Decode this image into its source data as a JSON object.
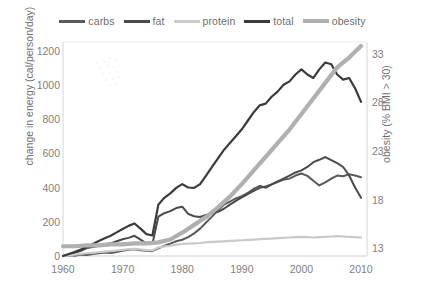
{
  "chart_data": {
    "type": "line",
    "title": "",
    "xlabel": "",
    "ylabel": "change in energy (cal/person/day)",
    "y2label": "obesity (% BMI > 30)",
    "grid": false,
    "legend_position": "top",
    "xlim": [
      1960,
      2011
    ],
    "ylim": [
      0,
      1250
    ],
    "y2lim": [
      12.2,
      34.2
    ],
    "xticks": [
      "1960",
      "1970",
      "1980",
      "1990",
      "2000",
      "2010"
    ],
    "xtick_values": [
      1960,
      1970,
      1980,
      1990,
      2000,
      2010
    ],
    "yticks": [
      "0",
      "200",
      "400",
      "600",
      "800",
      "1000",
      "1200"
    ],
    "ytick_values": [
      0,
      200,
      400,
      600,
      800,
      1000,
      1200
    ],
    "y2ticks": [
      "13",
      "18",
      "23",
      "28",
      "33"
    ],
    "y2tick_values": [
      13,
      18,
      23,
      28,
      33
    ],
    "series": [
      {
        "name": "carbs",
        "color": "#595959",
        "width": 2.0,
        "axis": "left",
        "x": [
          1960,
          1961,
          1962,
          1963,
          1964,
          1965,
          1966,
          1967,
          1968,
          1969,
          1970,
          1971,
          1972,
          1973,
          1974,
          1975,
          1976,
          1977,
          1978,
          1979,
          1980,
          1981,
          1982,
          1983,
          1984,
          1985,
          1986,
          1987,
          1988,
          1989,
          1990,
          1991,
          1992,
          1993,
          1994,
          1995,
          1996,
          1997,
          1998,
          1999,
          2000,
          2001,
          2002,
          2003,
          2004,
          2005,
          2006,
          2007,
          2008,
          2009,
          2010
        ],
        "values": [
          0,
          5,
          2,
          8,
          6,
          12,
          16,
          20,
          18,
          24,
          30,
          36,
          40,
          34,
          30,
          28,
          45,
          60,
          72,
          86,
          95,
          110,
          132,
          160,
          196,
          230,
          268,
          300,
          318,
          336,
          350,
          368,
          392,
          410,
          398,
          418,
          432,
          446,
          452,
          470,
          482,
          468,
          440,
          412,
          430,
          452,
          470,
          466,
          478,
          470,
          460
        ]
      },
      {
        "name": "fat",
        "color": "#4a4a4a",
        "width": 2.0,
        "axis": "left",
        "x": [
          1960,
          1961,
          1962,
          1963,
          1964,
          1965,
          1966,
          1967,
          1968,
          1969,
          1970,
          1971,
          1972,
          1973,
          1974,
          1975,
          1976,
          1977,
          1978,
          1979,
          1980,
          1981,
          1982,
          1983,
          1984,
          1985,
          1986,
          1987,
          1988,
          1989,
          1990,
          1991,
          1992,
          1993,
          1994,
          1995,
          1996,
          1997,
          1998,
          1999,
          2000,
          2001,
          2002,
          2003,
          2004,
          2005,
          2006,
          2007,
          2008,
          2009,
          2010
        ],
        "values": [
          0,
          10,
          18,
          30,
          46,
          52,
          60,
          68,
          74,
          86,
          98,
          106,
          118,
          96,
          74,
          70,
          230,
          250,
          262,
          280,
          288,
          246,
          232,
          228,
          240,
          250,
          258,
          276,
          300,
          322,
          342,
          362,
          380,
          398,
          406,
          418,
          436,
          452,
          470,
          488,
          500,
          520,
          548,
          562,
          578,
          560,
          542,
          520,
          470,
          400,
          340
        ]
      },
      {
        "name": "protein",
        "color": "#c9c9c9",
        "width": 2.2,
        "axis": "left",
        "x": [
          1960,
          1961,
          1962,
          1963,
          1964,
          1965,
          1966,
          1967,
          1968,
          1969,
          1970,
          1971,
          1972,
          1973,
          1974,
          1975,
          1976,
          1977,
          1978,
          1979,
          1980,
          1981,
          1982,
          1983,
          1984,
          1985,
          1986,
          1987,
          1988,
          1989,
          1990,
          1991,
          1992,
          1993,
          1994,
          1995,
          1996,
          1997,
          1998,
          1999,
          2000,
          2001,
          2002,
          2003,
          2004,
          2005,
          2006,
          2007,
          2008,
          2009,
          2010
        ],
        "values": [
          0,
          4,
          8,
          12,
          16,
          18,
          22,
          26,
          28,
          32,
          36,
          40,
          42,
          38,
          34,
          32,
          50,
          56,
          60,
          66,
          70,
          72,
          74,
          76,
          80,
          82,
          84,
          86,
          88,
          90,
          92,
          94,
          96,
          98,
          100,
          102,
          104,
          106,
          108,
          110,
          112,
          110,
          108,
          110,
          112,
          114,
          116,
          114,
          112,
          110,
          108
        ]
      },
      {
        "name": "total",
        "color": "#3b3b3b",
        "width": 2.2,
        "axis": "left",
        "x": [
          1960,
          1961,
          1962,
          1963,
          1964,
          1965,
          1966,
          1967,
          1968,
          1969,
          1970,
          1971,
          1972,
          1973,
          1974,
          1975,
          1976,
          1977,
          1978,
          1979,
          1980,
          1981,
          1982,
          1983,
          1984,
          1985,
          1986,
          1987,
          1988,
          1989,
          1990,
          1991,
          1992,
          1993,
          1994,
          1995,
          1996,
          1997,
          1998,
          1999,
          2000,
          2001,
          2002,
          2003,
          2004,
          2005,
          2006,
          2007,
          2008,
          2009,
          2010
        ],
        "values": [
          0,
          12,
          24,
          38,
          56,
          70,
          88,
          104,
          118,
          138,
          158,
          176,
          190,
          160,
          128,
          120,
          300,
          340,
          366,
          398,
          420,
          400,
          398,
          420,
          470,
          520,
          570,
          620,
          660,
          700,
          740,
          790,
          840,
          880,
          890,
          930,
          960,
          1000,
          1020,
          1060,
          1090,
          1060,
          1040,
          1090,
          1130,
          1120,
          1060,
          1030,
          1040,
          980,
          900
        ]
      },
      {
        "name": "obesity",
        "color": "#b0b0b0",
        "width": 4.2,
        "axis": "right",
        "x": [
          1960,
          1962,
          1964,
          1966,
          1968,
          1970,
          1972,
          1974,
          1976,
          1978,
          1980,
          1982,
          1984,
          1986,
          1988,
          1990,
          1992,
          1994,
          1996,
          1998,
          2000,
          2002,
          2004,
          2006,
          2008,
          2010
        ],
        "values": [
          13.2,
          13.2,
          13.3,
          13.3,
          13.4,
          13.4,
          13.5,
          13.5,
          13.6,
          13.9,
          14.6,
          15.4,
          16.2,
          17.2,
          18.3,
          19.6,
          21.0,
          22.4,
          23.8,
          25.2,
          26.8,
          28.4,
          30.0,
          31.6,
          32.6,
          33.8
        ]
      }
    ]
  },
  "legend": {
    "items": [
      {
        "label": "carbs",
        "color": "#595959",
        "thickness": 3
      },
      {
        "label": "fat",
        "color": "#4a4a4a",
        "thickness": 3
      },
      {
        "label": "protein",
        "color": "#cccccc",
        "thickness": 3
      },
      {
        "label": "total",
        "color": "#3b3b3b",
        "thickness": 3
      },
      {
        "label": "obesity",
        "color": "#b0b0b0",
        "thickness": 4
      }
    ]
  }
}
